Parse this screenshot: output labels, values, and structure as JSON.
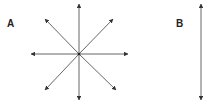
{
  "panels": [
    {
      "label": "A",
      "description": "eight arrows radiating from a central point"
    },
    {
      "label": "B",
      "description": "single vertical double-headed arrow"
    }
  ],
  "colors": {
    "stroke": "#444444",
    "text": "#222222"
  }
}
